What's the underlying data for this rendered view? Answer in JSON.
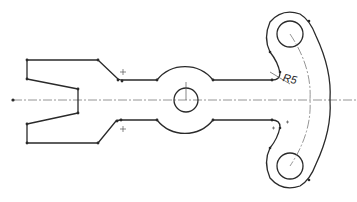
{
  "drawing": {
    "type": "cad-sketch",
    "background": "#ffffff",
    "line_color": "#2a2a2a",
    "centerline_color": "#7a7a7a",
    "annotations": {
      "fillet_radius": "R5"
    },
    "features": [
      {
        "name": "forked-left-end",
        "description": "V-notch fork profile"
      },
      {
        "name": "central-hub",
        "description": "circular hub with center hole"
      },
      {
        "name": "curved-right-arm",
        "description": "arc-shaped arm with two holes"
      },
      {
        "name": "horizontal-centerline"
      },
      {
        "name": "arc-centerline"
      }
    ]
  }
}
